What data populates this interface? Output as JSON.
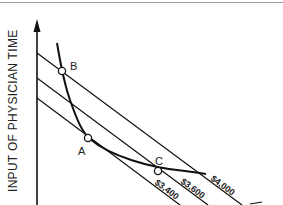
{
  "diagram": {
    "y_axis_label": "INPUT OF PHYSICIAN TIME",
    "points": {
      "A": "A",
      "B": "B",
      "C": "C"
    },
    "budget_lines": [
      {
        "label": "$3,400"
      },
      {
        "label": "$3,600"
      },
      {
        "label": "$4,000"
      }
    ],
    "colors": {
      "ink": "#111111",
      "background": "#ffffff"
    }
  }
}
